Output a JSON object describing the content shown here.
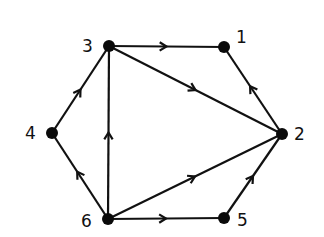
{
  "diagram": {
    "type": "directed-graph",
    "nodes": [
      {
        "id": "1",
        "label": "1",
        "x": 224,
        "y": 47,
        "label_dx": 12,
        "label_dy": -4
      },
      {
        "id": "2",
        "label": "2",
        "x": 282,
        "y": 134,
        "label_dx": 12,
        "label_dy": 6
      },
      {
        "id": "3",
        "label": "3",
        "x": 109,
        "y": 46,
        "label_dx": -27,
        "label_dy": 6
      },
      {
        "id": "4",
        "label": "4",
        "x": 52,
        "y": 133,
        "label_dx": -27,
        "label_dy": 6
      },
      {
        "id": "5",
        "label": "5",
        "x": 224,
        "y": 218,
        "label_dx": 13,
        "label_dy": 8
      },
      {
        "id": "6",
        "label": "6",
        "x": 108,
        "y": 219,
        "label_dx": -27,
        "label_dy": 8
      }
    ],
    "edges": [
      {
        "from": "3",
        "to": "1",
        "arrow_pos": 0.5
      },
      {
        "from": "3",
        "to": "2",
        "arrow_pos": 0.5
      },
      {
        "from": "2",
        "to": "1",
        "arrow_pos": 0.55
      },
      {
        "from": "4",
        "to": "3",
        "arrow_pos": 0.5
      },
      {
        "from": "6",
        "to": "4",
        "arrow_pos": 0.55
      },
      {
        "from": "6",
        "to": "3",
        "arrow_pos": 0.5
      },
      {
        "from": "6",
        "to": "2",
        "arrow_pos": 0.5
      },
      {
        "from": "6",
        "to": "5",
        "arrow_pos": 0.5
      },
      {
        "from": "5",
        "to": "2",
        "arrow_pos": 0.5
      }
    ],
    "colors": {
      "stroke": "#111111",
      "node": "#0a0a0a",
      "background": "#ffffff"
    }
  }
}
